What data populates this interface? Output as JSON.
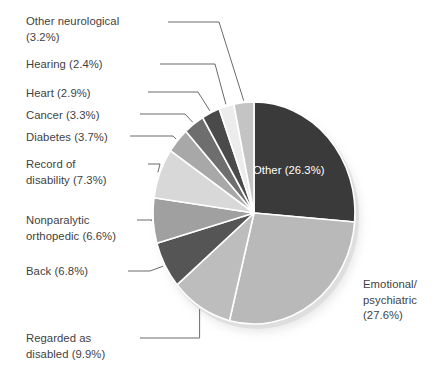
{
  "chart_data": {
    "type": "pie",
    "title": "",
    "subtitle": "",
    "xlabel": "",
    "ylabel": "",
    "legend_position": "callout-labels",
    "grid": false,
    "units": "percent",
    "total": 100.0,
    "categories": [
      "Other",
      "Emotional/psychiatric",
      "Regarded as disabled",
      "Back",
      "Nonparalytic orthopedic",
      "Record of disability",
      "Diabetes",
      "Cancer",
      "Heart",
      "Hearing",
      "Other neurological"
    ],
    "values": [
      26.3,
      27.6,
      9.9,
      6.8,
      6.6,
      7.3,
      3.7,
      3.3,
      2.9,
      2.4,
      3.2
    ],
    "colors": [
      "#3a3a3a",
      "#b9b9b9",
      "#bdbdbd",
      "#555555",
      "#a0a0a0",
      "#d8d8d8",
      "#a8a8a8",
      "#6e6e6e",
      "#4a4a4a",
      "#ececec",
      "#c4c4c4"
    ],
    "slices": [
      {
        "label": "Other",
        "value": 26.3,
        "text": "Other (26.3%)",
        "color": "#3a3a3a",
        "label_placement": "inside",
        "label_color": "#ffffff"
      },
      {
        "label": "Emotional/psychiatric",
        "value": 27.6,
        "text": "Emotional/\npsychiatric\n(27.6%)",
        "color": "#b9b9b9",
        "label_placement": "right",
        "label_color": "#3f3f3f"
      },
      {
        "label": "Regarded as disabled",
        "value": 9.9,
        "text": "Regarded as\ndisabled (9.9%)",
        "color": "#bdbdbd",
        "label_placement": "left",
        "label_color": "#3f3f3f"
      },
      {
        "label": "Back",
        "value": 6.8,
        "text": "Back (6.8%)",
        "color": "#555555",
        "label_placement": "left",
        "label_color": "#3f3f3f"
      },
      {
        "label": "Nonparalytic orthopedic",
        "value": 6.6,
        "text": "Nonparalytic\northopedic (6.6%)",
        "color": "#a0a0a0",
        "label_placement": "left",
        "label_color": "#3f3f3f"
      },
      {
        "label": "Record of disability",
        "value": 7.3,
        "text": "Record of\ndisability (7.3%)",
        "color": "#d8d8d8",
        "label_placement": "left",
        "label_color": "#3f3f3f"
      },
      {
        "label": "Diabetes",
        "value": 3.7,
        "text": "Diabetes (3.7%)",
        "color": "#a8a8a8",
        "label_placement": "left",
        "label_color": "#3f3f3f"
      },
      {
        "label": "Cancer",
        "value": 3.3,
        "text": "Cancer (3.3%)",
        "color": "#6e6e6e",
        "label_placement": "left",
        "label_color": "#3f3f3f"
      },
      {
        "label": "Heart",
        "value": 2.9,
        "text": "Heart (2.9%)",
        "color": "#4a4a4a",
        "label_placement": "left",
        "label_color": "#3f3f3f"
      },
      {
        "label": "Hearing",
        "value": 2.4,
        "text": "Hearing (2.4%)",
        "color": "#ececec",
        "label_placement": "left",
        "label_color": "#3f3f3f"
      },
      {
        "label": "Other neurological",
        "value": 3.2,
        "text": "Other neurological\n(3.2%)",
        "color": "#c4c4c4",
        "label_placement": "left",
        "label_color": "#3f3f3f"
      }
    ]
  },
  "labels": {
    "other_neurological": "Other neurological\n(3.2%)",
    "hearing": "Hearing (2.4%)",
    "heart": "Heart (2.9%)",
    "cancer": "Cancer (3.3%)",
    "diabetes": "Diabetes (3.7%)",
    "record_of_disability": "Record of\ndisability (7.3%)",
    "nonparalytic_orthopedic": "Nonparalytic\northopedic (6.6%)",
    "back": "Back (6.8%)",
    "regarded_as_disabled": "Regarded as\ndisabled (9.9%)",
    "emotional_psychiatric": "Emotional/\npsychiatric\n(27.6%)",
    "other_inside": "Other (26.3%)"
  },
  "style": {
    "background": "#ffffff",
    "text_color": "#3f3f3f",
    "inner_label_color": "#ffffff",
    "leader_line_color": "#5a5a5a",
    "slice_separator_color": "#ffffff"
  }
}
